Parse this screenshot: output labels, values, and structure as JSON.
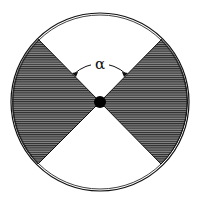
{
  "diagram": {
    "label_angle": "α",
    "colors": {
      "stroke": "#111111",
      "hatch_fill": "#6a6a6a",
      "hatch_line": "#222222",
      "background": "#ffffff",
      "center_dot": "#000000"
    },
    "circle": {
      "cx": 100,
      "cy": 102,
      "r": 89
    },
    "center_dot": {
      "cx": 100,
      "cy": 102,
      "r": 6
    },
    "wedges": [
      {
        "name": "left-wedge",
        "points": [
          [
            38,
            39
          ],
          [
            100,
            102
          ],
          [
            38,
            164
          ]
        ]
      },
      {
        "name": "right-wedge",
        "points": [
          [
            162,
            39
          ],
          [
            100,
            102
          ],
          [
            161,
            164
          ]
        ]
      }
    ]
  }
}
